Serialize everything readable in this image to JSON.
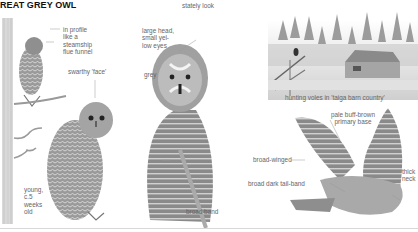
{
  "page": {
    "title": "REAT GREY OWL"
  },
  "labels": {
    "profile": [
      "in profile",
      "like a",
      "steamship",
      "flue funnel"
    ],
    "swarthy_face": "swarthy 'face'",
    "young": [
      "young,",
      "c.5",
      "weeks",
      "old"
    ],
    "stately_look": "stately look",
    "large_head": [
      "large head,",
      "small yel-",
      "low eyes"
    ],
    "grey": "grey",
    "broad_band": "broad band",
    "hunting": "hunting voles in 'taiga barn country'",
    "pale_buff": [
      "pale buff-brown",
      "primary base"
    ],
    "broad_winged": "broad-winged",
    "broad_tail_band": "broad dark tail-band",
    "thick_neck": [
      "thick",
      "neck"
    ]
  },
  "colors": {
    "ink": "#555555",
    "title": "#111111",
    "plumage_dark": "#6b6b6b",
    "plumage_light": "#bdbdbd",
    "background": "#ffffff"
  }
}
